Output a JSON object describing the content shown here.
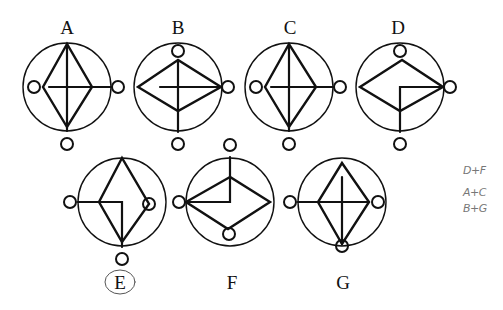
{
  "puzzle": {
    "figures": [
      {
        "id": "A",
        "label": "A",
        "cx": 67,
        "cy": 87,
        "label_x": 67,
        "label_y": 18,
        "circled": false
      },
      {
        "id": "B",
        "label": "B",
        "cx": 178,
        "cy": 87,
        "label_x": 178,
        "label_y": 18,
        "circled": false
      },
      {
        "id": "C",
        "label": "C",
        "cx": 289,
        "cy": 87,
        "label_x": 290,
        "label_y": 18,
        "circled": false
      },
      {
        "id": "D",
        "label": "D",
        "cx": 400,
        "cy": 87,
        "label_x": 398,
        "label_y": 18,
        "circled": false
      },
      {
        "id": "E",
        "label": "E",
        "cx": 122,
        "cy": 202,
        "label_x": 120,
        "label_y": 272,
        "circled": true
      },
      {
        "id": "F",
        "label": "F",
        "cx": 230,
        "cy": 202,
        "label_x": 232,
        "label_y": 272,
        "circled": false
      },
      {
        "id": "G",
        "label": "G",
        "cx": 342,
        "cy": 202,
        "label_x": 343,
        "label_y": 272,
        "circled": false
      }
    ],
    "annotation_color": "#777777",
    "line_color": "#111111"
  },
  "handwritten_notes": {
    "line1": "D+F",
    "line2": "A+C",
    "line3": "B+G"
  }
}
